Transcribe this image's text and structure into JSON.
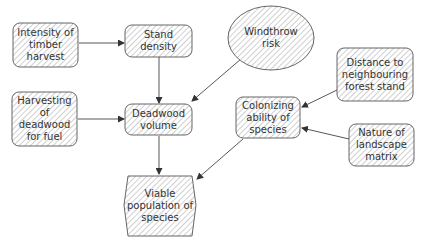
{
  "diagram": {
    "colors": {
      "stroke": "#555555",
      "hatch": "#9a9a9a",
      "fill": "#ffffff",
      "text": "#333333",
      "arrow": "#333333"
    },
    "nodes": [
      {
        "id": "intensity",
        "label": "Intensity of\ntimber\nharvest",
        "shape": "rounded-rect"
      },
      {
        "id": "stand",
        "label": "Stand\ndensity",
        "shape": "rounded-rect"
      },
      {
        "id": "windthrow",
        "label": "Windthrow\nrisk",
        "shape": "ellipse"
      },
      {
        "id": "distance",
        "label": "Distance to\nneighbouring\nforest stand",
        "shape": "rounded-rect"
      },
      {
        "id": "harvesting",
        "label": "Harvesting\nof\ndeadwood\nfor fuel",
        "shape": "rounded-rect"
      },
      {
        "id": "deadwood",
        "label": "Deadwood\nvolume",
        "shape": "rounded-rect"
      },
      {
        "id": "colonizing",
        "label": "Colonizing\nability of\nspecies",
        "shape": "rounded-rect"
      },
      {
        "id": "landscape",
        "label": "Nature of\nlandscape\nmatrix",
        "shape": "rounded-rect"
      },
      {
        "id": "viable",
        "label": "Viable\npopulation of\nspecies",
        "shape": "hexagon"
      }
    ],
    "edges": [
      {
        "from": "intensity",
        "to": "stand"
      },
      {
        "from": "stand",
        "to": "deadwood"
      },
      {
        "from": "windthrow",
        "to": "deadwood"
      },
      {
        "from": "harvesting",
        "to": "deadwood"
      },
      {
        "from": "deadwood",
        "to": "viable"
      },
      {
        "from": "distance",
        "to": "colonizing"
      },
      {
        "from": "landscape",
        "to": "colonizing"
      },
      {
        "from": "colonizing",
        "to": "viable"
      }
    ]
  }
}
